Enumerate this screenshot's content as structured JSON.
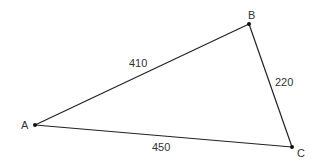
{
  "diagram": {
    "type": "triangle",
    "colors": {
      "stroke": "#222222",
      "point": "#111111",
      "text": "#333333",
      "background": "#ffffff"
    },
    "vertices": [
      {
        "id": "A",
        "label": "A",
        "x": 35,
        "y": 125,
        "label_x": 23,
        "label_y": 129
      },
      {
        "id": "B",
        "label": "B",
        "x": 249,
        "y": 24,
        "label_x": 248,
        "label_y": 18
      },
      {
        "id": "C",
        "label": "C",
        "x": 292,
        "y": 147,
        "label_x": 297,
        "label_y": 157
      }
    ],
    "sides": [
      {
        "from": "A",
        "to": "B",
        "label": "410",
        "label_x": 130,
        "label_y": 66
      },
      {
        "from": "B",
        "to": "C",
        "label": "220",
        "label_x": 276,
        "label_y": 85
      },
      {
        "from": "A",
        "to": "C",
        "label": "450",
        "label_x": 153,
        "label_y": 151
      }
    ]
  }
}
